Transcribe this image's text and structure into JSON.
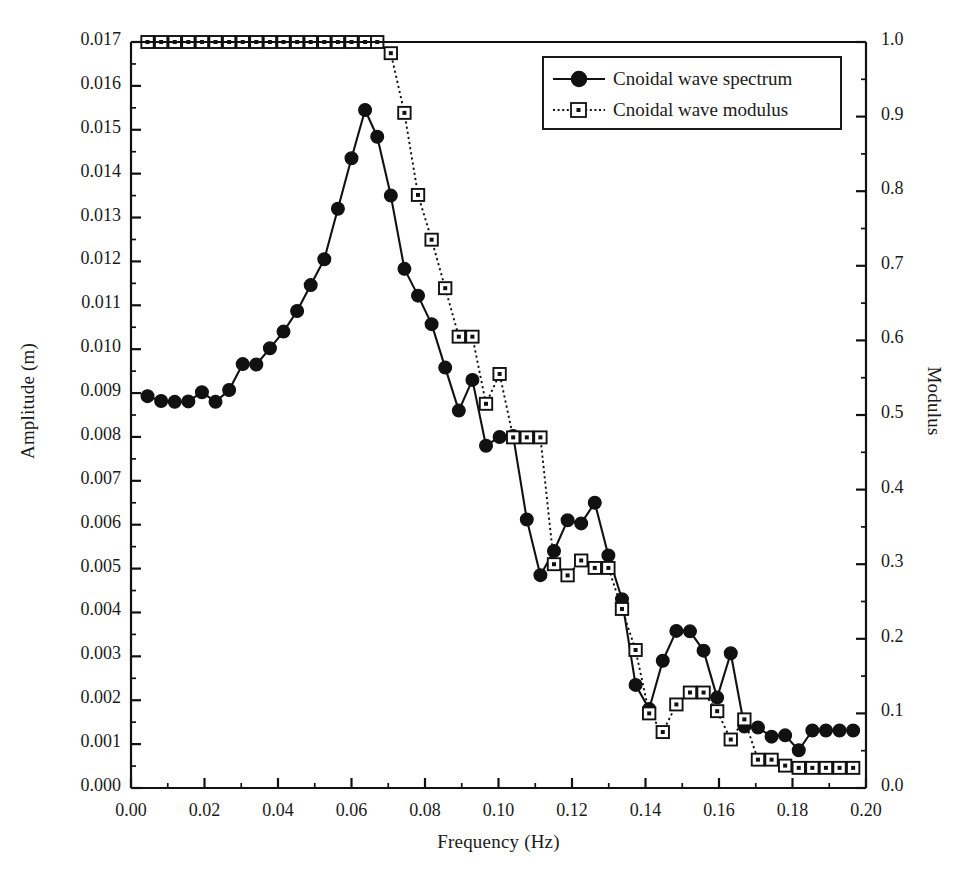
{
  "chart_data": {
    "type": "line",
    "title": "",
    "xlabel": "Frequency (Hz)",
    "ylabel": "Amplitude (m)",
    "y2label": "Modulus",
    "xlim": [
      0.0,
      0.2
    ],
    "ylim": [
      0.0,
      0.017
    ],
    "y2lim": [
      0.0,
      1.0
    ],
    "grid": false,
    "legend_position": "top-right",
    "xticks": [
      "0.00",
      "0.02",
      "0.04",
      "0.06",
      "0.08",
      "0.10",
      "0.12",
      "0.14",
      "0.16",
      "0.18",
      "0.20"
    ],
    "xtick_values": [
      0.0,
      0.02,
      0.04,
      0.06,
      0.08,
      0.1,
      0.12,
      0.14,
      0.16,
      0.18,
      0.2
    ],
    "xminor_step": 0.01,
    "yticks": [
      "0.000",
      "0.001",
      "0.002",
      "0.003",
      "0.004",
      "0.005",
      "0.006",
      "0.007",
      "0.008",
      "0.009",
      "0.010",
      "0.011",
      "0.012",
      "0.013",
      "0.014",
      "0.015",
      "0.016",
      "0.017"
    ],
    "ytick_values": [
      0.0,
      0.001,
      0.002,
      0.003,
      0.004,
      0.005,
      0.006,
      0.007,
      0.008,
      0.009,
      0.01,
      0.011,
      0.012,
      0.013,
      0.014,
      0.015,
      0.016,
      0.017
    ],
    "yminor_step": 0.0005,
    "y2ticks": [
      "0.0",
      "0.1",
      "0.2",
      "0.3",
      "0.4",
      "0.5",
      "0.6",
      "0.7",
      "0.8",
      "0.9",
      "1.0"
    ],
    "y2tick_values": [
      0.0,
      0.1,
      0.2,
      0.3,
      0.4,
      0.5,
      0.6,
      0.7,
      0.8,
      0.9,
      1.0
    ],
    "y2minor_step": 0.05,
    "series": [
      {
        "name": "Cnoidal wave spectrum",
        "axis": "left",
        "marker": "filled-circle",
        "linestyle": "solid",
        "color": "#111111",
        "x": [
          0.0045,
          0.0082,
          0.0119,
          0.0156,
          0.0193,
          0.023,
          0.0267,
          0.0304,
          0.0341,
          0.0378,
          0.0415,
          0.0452,
          0.0489,
          0.0526,
          0.0563,
          0.06,
          0.0637,
          0.067,
          0.0707,
          0.0744,
          0.0781,
          0.0818,
          0.0855,
          0.0892,
          0.0929,
          0.0966,
          0.1003,
          0.104,
          0.1077,
          0.1114,
          0.1151,
          0.1188,
          0.1225,
          0.1262,
          0.1299,
          0.1336,
          0.1373,
          0.141,
          0.1447,
          0.1484,
          0.1521,
          0.1558,
          0.1595,
          0.1632,
          0.1669,
          0.1706,
          0.1743,
          0.178,
          0.1817,
          0.1854,
          0.1891,
          0.1928,
          0.1965
        ],
        "y": [
          0.00893,
          0.00882,
          0.0088,
          0.00881,
          0.00902,
          0.0088,
          0.00907,
          0.00966,
          0.00965,
          0.01002,
          0.0104,
          0.01087,
          0.01146,
          0.01205,
          0.0132,
          0.01435,
          0.01545,
          0.01484,
          0.0135,
          0.01183,
          0.01122,
          0.01057,
          0.00958,
          0.0086,
          0.0093,
          0.0078,
          0.008,
          0.00802,
          0.00612,
          0.00485,
          0.0054,
          0.0061,
          0.00603,
          0.0065,
          0.0053,
          0.0043,
          0.00235,
          0.0018,
          0.0029,
          0.00358,
          0.00357,
          0.00313,
          0.00206,
          0.00307,
          0.0014,
          0.00138,
          0.00117,
          0.0012,
          0.00086,
          0.00131,
          0.00131,
          0.00131,
          0.00131
        ]
      },
      {
        "name": "Cnoidal wave modulus",
        "axis": "right",
        "marker": "open-square",
        "linestyle": "dotted",
        "color": "#111111",
        "x": [
          0.0045,
          0.0082,
          0.0119,
          0.0156,
          0.0193,
          0.023,
          0.0267,
          0.0304,
          0.0341,
          0.0378,
          0.0415,
          0.0452,
          0.0489,
          0.0526,
          0.0563,
          0.06,
          0.0637,
          0.067,
          0.0707,
          0.0744,
          0.0781,
          0.0818,
          0.0855,
          0.0892,
          0.0929,
          0.0966,
          0.1003,
          0.104,
          0.1077,
          0.1114,
          0.1151,
          0.1188,
          0.1225,
          0.1262,
          0.1299,
          0.1336,
          0.1373,
          0.141,
          0.1447,
          0.1484,
          0.1521,
          0.1558,
          0.1595,
          0.1632,
          0.1669,
          0.1706,
          0.1743,
          0.178,
          0.1817,
          0.1854,
          0.1891,
          0.1928,
          0.1965
        ],
        "y": [
          1.0,
          1.0,
          1.0,
          1.0,
          1.0,
          1.0,
          1.0,
          1.0,
          1.0,
          1.0,
          1.0,
          1.0,
          1.0,
          1.0,
          1.0,
          1.0,
          1.0,
          1.0,
          0.985,
          0.905,
          0.795,
          0.735,
          0.67,
          0.605,
          0.605,
          0.515,
          0.555,
          0.47,
          0.47,
          0.47,
          0.3,
          0.285,
          0.305,
          0.295,
          0.295,
          0.24,
          0.185,
          0.1,
          0.075,
          0.112,
          0.128,
          0.128,
          0.103,
          0.065,
          0.092,
          0.038,
          0.038,
          0.03,
          0.027,
          0.027,
          0.027,
          0.027,
          0.027
        ]
      }
    ]
  },
  "legend": {
    "entries": [
      {
        "label": "Cnoidal wave spectrum",
        "marker": "filled-circle",
        "linestyle": "solid"
      },
      {
        "label": "Cnoidal wave modulus",
        "marker": "open-square",
        "linestyle": "dotted"
      }
    ]
  }
}
